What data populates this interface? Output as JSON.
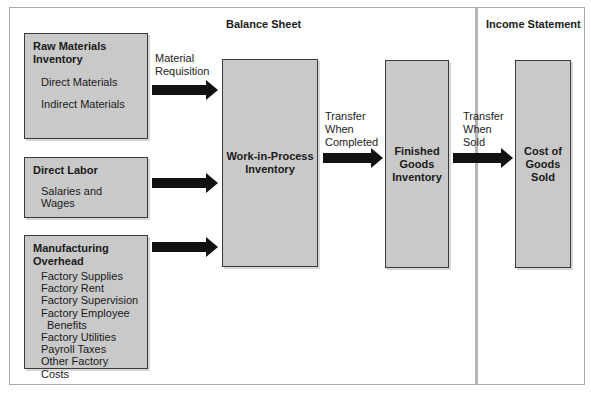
{
  "sections": {
    "balance_sheet": "Balance Sheet",
    "income_statement": "Income Statement"
  },
  "raw_materials": {
    "title_line1": "Raw Materials",
    "title_line2": "Inventory",
    "items": [
      "Direct Materials",
      "Indirect Materials"
    ]
  },
  "direct_labor": {
    "title": "Direct Labor",
    "items": [
      "Salaries and Wages"
    ]
  },
  "manufacturing_overhead": {
    "title_line1": "Manufacturing",
    "title_line2": "Overhead",
    "items": [
      "Factory Supplies",
      "Factory Rent",
      "Factory Supervision",
      "Factory Employee",
      "Benefits",
      "Factory Utilities",
      "Payroll Taxes",
      "Other Factory Costs"
    ]
  },
  "wip": {
    "line1": "Work-in-Process",
    "line2": "Inventory"
  },
  "finished_goods": {
    "line1": "Finished",
    "line2": "Goods",
    "line3": "Inventory"
  },
  "cogs": {
    "line1": "Cost of",
    "line2": "Goods",
    "line3": "Sold"
  },
  "arrows": {
    "material_requisition": {
      "line1": "Material",
      "line2": "Requisition"
    },
    "transfer_completed": {
      "line1": "Transfer",
      "line2": "When",
      "line3": "Completed"
    },
    "transfer_sold": {
      "line1": "Transfer",
      "line2": "When",
      "line3": "Sold"
    }
  }
}
